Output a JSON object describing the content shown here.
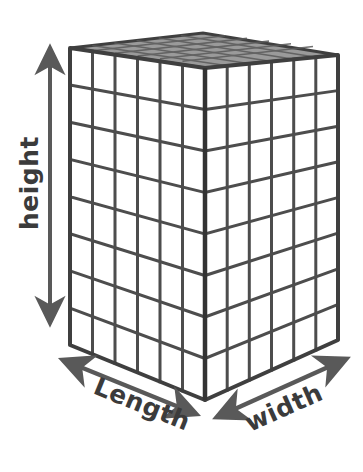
{
  "figure": {
    "background_color": "#ffffff",
    "line_color": "#4d4d4d",
    "edge_color": "#3f3f3f",
    "arrow_color": "#595959",
    "label_color": "#3b3b3b",
    "top_face_color": "#8a8a8a"
  },
  "labels": {
    "height": "height",
    "length": "Length",
    "width": "width"
  },
  "geometry": {
    "front_top": [
      205,
      68
    ],
    "front_bottom": [
      205,
      400
    ],
    "left_top": [
      70,
      48
    ],
    "left_bottom": [
      70,
      345
    ],
    "right_top": [
      338,
      55
    ],
    "right_bottom": [
      338,
      340
    ],
    "back_top": [
      203,
      33
    ],
    "left_columns": 6,
    "right_columns": 6,
    "rows": 8
  },
  "arrows": {
    "height": {
      "from": [
        50,
        45
      ],
      "to": [
        50,
        326
      ],
      "double_headed": true
    },
    "length": {
      "from": [
        60,
        358
      ],
      "to": [
        198,
        415
      ],
      "double_headed": true
    },
    "width": {
      "from": [
        215,
        418
      ],
      "to": [
        348,
        358
      ],
      "double_headed": true
    }
  }
}
